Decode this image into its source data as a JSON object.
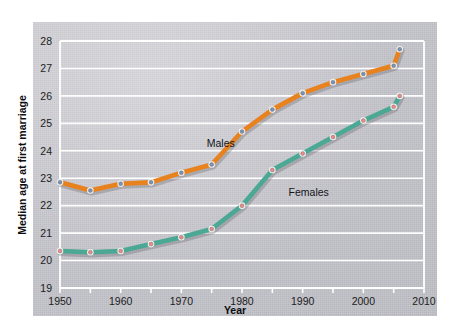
{
  "chart_data": {
    "type": "line",
    "title": "",
    "xlabel": "Year",
    "ylabel": "Median age at first marriage",
    "xlim": [
      1950,
      2010
    ],
    "ylim": [
      19,
      28
    ],
    "grid": "horizontal",
    "legend_position": "inline-labels",
    "x_ticks": [
      1950,
      1960,
      1970,
      1980,
      1990,
      2000,
      2010
    ],
    "x_minor_tick_interval": 5,
    "y_ticks": [
      19,
      20,
      21,
      22,
      23,
      24,
      25,
      26,
      27,
      28
    ],
    "x": [
      1950,
      1955,
      1960,
      1965,
      1970,
      1975,
      1980,
      1985,
      1990,
      1995,
      2000,
      2005,
      2006
    ],
    "series": [
      {
        "name": "Males",
        "color": "#e8821e",
        "marker_fill": "#7c94b4",
        "marker_ring": "#f2f2f2",
        "values": [
          22.85,
          22.55,
          22.8,
          22.85,
          23.2,
          23.5,
          24.7,
          25.5,
          26.1,
          26.5,
          26.8,
          27.1,
          27.7
        ]
      },
      {
        "name": "Females",
        "color": "#4ba894",
        "marker_fill": "#e98b86",
        "marker_ring": "#f2f2f2",
        "values": [
          20.35,
          20.3,
          20.35,
          20.6,
          20.85,
          21.15,
          22.0,
          23.3,
          23.9,
          24.5,
          25.1,
          25.6,
          26.0
        ]
      }
    ],
    "annotations": [
      {
        "text": "Males",
        "x": 1976.5,
        "y": 24.15
      },
      {
        "text": "Females",
        "x": 1991.0,
        "y": 22.35
      }
    ]
  }
}
